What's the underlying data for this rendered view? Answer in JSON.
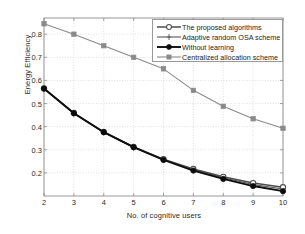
{
  "chart_data": {
    "type": "line",
    "title": "",
    "xlabel": "No. of cognitive users",
    "ylabel": "Energy Efficiency",
    "x": [
      2,
      3,
      4,
      5,
      6,
      7,
      8,
      9,
      10
    ],
    "xlim": [
      2,
      10
    ],
    "ylim": [
      0.1,
      0.87
    ],
    "xticks": [
      "2",
      "3",
      "4",
      "5",
      "6",
      "7",
      "8",
      "9",
      "10"
    ],
    "yticks": [
      "0.2",
      "0.3",
      "0.4",
      "0.5",
      "0.6",
      "0.7",
      "0.8"
    ],
    "ytick_values": [
      0.2,
      0.3,
      0.4,
      0.5,
      0.6,
      0.7,
      0.8
    ],
    "grid": true,
    "legend_position": "upper right",
    "series": [
      {
        "name": "The proposed algorithms",
        "marker": "open-circle",
        "color": "#4d4d4d",
        "values": [
          0.565,
          0.459,
          0.377,
          0.312,
          0.259,
          0.217,
          0.183,
          0.156,
          0.138
        ]
      },
      {
        "name": "Adaptive random OSA scheme",
        "marker": "plus-tick",
        "color": "#555555",
        "values": [
          0.563,
          0.457,
          0.375,
          0.31,
          0.257,
          0.214,
          0.179,
          0.15,
          0.13
        ]
      },
      {
        "name": "Without learning",
        "marker": "filled-circle",
        "color": "#0d0d0d",
        "values": [
          0.565,
          0.458,
          0.376,
          0.311,
          0.256,
          0.21,
          0.174,
          0.143,
          0.121
        ]
      },
      {
        "name": "Centralized allocation scheme",
        "marker": "filled-square",
        "color": "#8a8a8a",
        "values": [
          0.845,
          0.8,
          0.75,
          0.7,
          0.65,
          0.557,
          0.488,
          0.434,
          0.393
        ]
      }
    ]
  },
  "legend": {
    "items": [
      {
        "label": "The proposed algorithms"
      },
      {
        "label": "Adaptive random OSA scheme"
      },
      {
        "label": "Without learning"
      },
      {
        "label": "Centralized allocation scheme"
      }
    ]
  },
  "axes": {
    "frame_color": "#8c8c8c",
    "grid_color": "#c9c9c9",
    "background": "#ffffff"
  }
}
